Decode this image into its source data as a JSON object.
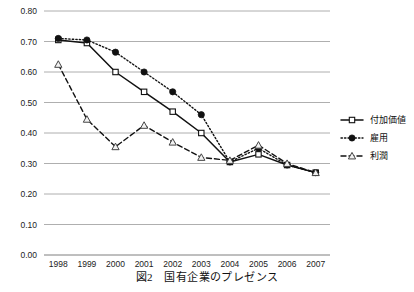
{
  "caption": "図2　国有企業のプレゼンス",
  "axes": {
    "y_ticks": [
      "0.00",
      "0.10",
      "0.20",
      "0.30",
      "0.40",
      "0.50",
      "0.60",
      "0.70",
      "0.80"
    ],
    "x_ticks": [
      "1998",
      "1999",
      "2000",
      "2001",
      "2002",
      "2003",
      "2004",
      "2005",
      "2006",
      "2007"
    ]
  },
  "legend": {
    "items": [
      {
        "label": "付加価値",
        "marker": "open-square",
        "line": "solid"
      },
      {
        "label": "雇用",
        "marker": "filled-circle",
        "line": "dotted"
      },
      {
        "label": "利潤",
        "marker": "open-triangle",
        "line": "dashed"
      }
    ]
  },
  "colors": {
    "ink": "#111111",
    "grid": "#9a9a9a",
    "axis": "#6f6f6f",
    "background": "#ffffff"
  },
  "chart_data": {
    "type": "line",
    "title": "図2　国有企業のプレゼンス",
    "xlabel": "",
    "ylabel": "",
    "x": [
      "1998",
      "1999",
      "2000",
      "2001",
      "2002",
      "2003",
      "2004",
      "2005",
      "2006",
      "2007"
    ],
    "ylim": [
      0.0,
      0.8
    ],
    "ytick_step": 0.1,
    "grid": true,
    "legend_position": "right",
    "series": [
      {
        "name": "付加価値",
        "marker": "open-square",
        "linestyle": "solid",
        "values": [
          0.705,
          0.695,
          0.6,
          0.535,
          0.47,
          0.4,
          0.305,
          0.33,
          0.295,
          0.27
        ]
      },
      {
        "name": "雇用",
        "marker": "filled-circle",
        "linestyle": "dotted",
        "values": [
          0.71,
          0.705,
          0.665,
          0.6,
          0.535,
          0.46,
          0.305,
          0.35,
          0.295,
          0.27
        ]
      },
      {
        "name": "利潤",
        "marker": "open-triangle",
        "linestyle": "dashed",
        "values": [
          0.625,
          0.445,
          0.355,
          0.425,
          0.37,
          0.32,
          0.31,
          0.36,
          0.3,
          0.27
        ]
      }
    ]
  }
}
